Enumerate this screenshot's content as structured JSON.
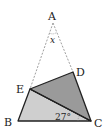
{
  "diagram": {
    "type": "geometry",
    "labels": {
      "A": "A",
      "B": "B",
      "C": "C",
      "D": "D",
      "E": "E",
      "x": "x",
      "angle": "27°"
    },
    "colors": {
      "light_fill": "#cfcfcf",
      "dark_fill": "#9a9a9a",
      "stroke": "#222222",
      "dashed": "#777777"
    }
  }
}
